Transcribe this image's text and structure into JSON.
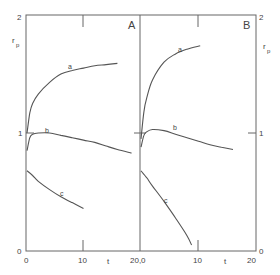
{
  "chart_data": [
    {
      "type": "line",
      "panel": "A",
      "xlabel": "t",
      "ylabel": "r_p",
      "xlim": [
        0,
        20
      ],
      "ylim": [
        0,
        2
      ],
      "xticks": [
        "0",
        "10",
        "20"
      ],
      "yticks": [
        "0",
        "1",
        "2"
      ],
      "grid": false,
      "series": [
        {
          "name": "a",
          "x": [
            0,
            0.5,
            1,
            2,
            4,
            6,
            8,
            10,
            12,
            14,
            16
          ],
          "y": [
            1.0,
            1.17,
            1.25,
            1.33,
            1.43,
            1.5,
            1.53,
            1.55,
            1.57,
            1.58,
            1.59
          ]
        },
        {
          "name": "b",
          "x": [
            0,
            0.5,
            1,
            2,
            4,
            6,
            8,
            10,
            12,
            14,
            16,
            18.5
          ],
          "y": [
            0.85,
            0.96,
            0.99,
            1.0,
            1.0,
            0.98,
            0.96,
            0.94,
            0.92,
            0.89,
            0.86,
            0.83
          ]
        },
        {
          "name": "c",
          "x": [
            0,
            1,
            2,
            4,
            6,
            8,
            10
          ],
          "y": [
            0.68,
            0.64,
            0.59,
            0.52,
            0.46,
            0.41,
            0.36
          ]
        }
      ]
    },
    {
      "type": "line",
      "panel": "B",
      "xlabel": "t",
      "ylabel": "r_p",
      "xlim": [
        0,
        20
      ],
      "ylim": [
        0,
        2
      ],
      "xticks": [
        "0",
        "10",
        "20"
      ],
      "yticks": [
        "0",
        "1",
        "2"
      ],
      "grid": false,
      "series": [
        {
          "name": "a",
          "x": [
            0,
            0.5,
            1,
            2,
            4,
            6,
            8,
            10.3
          ],
          "y": [
            0.95,
            1.18,
            1.3,
            1.45,
            1.6,
            1.67,
            1.71,
            1.74
          ]
        },
        {
          "name": "b",
          "x": [
            0,
            0.5,
            1,
            2,
            4,
            6,
            8,
            10,
            12,
            14,
            16
          ],
          "y": [
            0.88,
            0.98,
            1.01,
            1.03,
            1.02,
            0.99,
            0.96,
            0.93,
            0.9,
            0.88,
            0.86
          ]
        },
        {
          "name": "c",
          "x": [
            0,
            1,
            2,
            4,
            6,
            8,
            8.8
          ],
          "y": [
            0.68,
            0.62,
            0.55,
            0.42,
            0.28,
            0.13,
            0.05
          ]
        }
      ]
    }
  ],
  "labels": {
    "panel_a": "A",
    "panel_b": "B",
    "y_axis_label": "r",
    "y_axis_sub": "p",
    "x_axis_label": "t",
    "y_tick_0": "0",
    "y_tick_1": "1",
    "y_tick_2": "2",
    "x_tick_0": "0",
    "x_tick_10": "10",
    "x_tick_20_0": "20,0",
    "x_tick_20": "20",
    "curve_a": "a",
    "curve_b": "b",
    "curve_c": "c"
  },
  "colors": {
    "line": "#555555",
    "axis": "#666666"
  }
}
